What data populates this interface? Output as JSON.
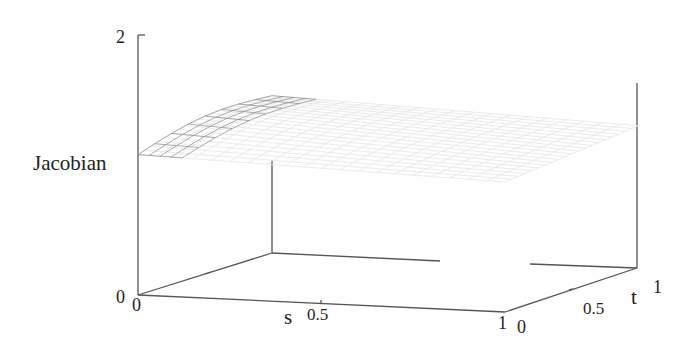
{
  "chart_data": {
    "type": "surface3d",
    "title": "",
    "xlabel": "s",
    "ylabel": "t",
    "zlabel": "Jacobian",
    "xlim": [
      0,
      1
    ],
    "ylim": [
      0,
      1
    ],
    "zlim": [
      0,
      2
    ],
    "x_ticks": [
      "0",
      "0.5",
      "1"
    ],
    "y_ticks": [
      "0",
      "0.5",
      "1"
    ],
    "z_ticks": [
      "0",
      "2"
    ],
    "grid": false,
    "legend": null,
    "surface_description": "Wireframe surface of the Jacobian over (s,t) in [0,1]x[0,1]; values roughly 1.0-1.2, slightly domed near s=0 and rising toward t=1; most of the mesh is rendered very faintly.",
    "approx_values": {
      "s": [
        0,
        0.25,
        0.5,
        0.75,
        1
      ],
      "t": [
        0,
        0.25,
        0.5,
        0.75,
        1
      ],
      "z": [
        [
          1.1,
          1.13,
          1.15,
          1.18,
          1.2
        ],
        [
          1.08,
          1.1,
          1.12,
          1.15,
          1.18
        ],
        [
          1.05,
          1.07,
          1.1,
          1.13,
          1.16
        ],
        [
          1.03,
          1.05,
          1.08,
          1.11,
          1.14
        ],
        [
          1.0,
          1.03,
          1.06,
          1.1,
          1.13
        ]
      ]
    }
  },
  "labels": {
    "zlabel": "Jacobian",
    "z_top": "2",
    "z_bottom": "0",
    "s_label": "s",
    "s_0": "0",
    "s_05": "0.5",
    "s_1": "1",
    "t_label": "t",
    "t_0": "0",
    "t_05": "0.5",
    "t_1": "1"
  },
  "colors": {
    "axis": "#555555",
    "mesh_dark": "#8a8a8a",
    "mesh_faint": "#e6e6e6"
  }
}
